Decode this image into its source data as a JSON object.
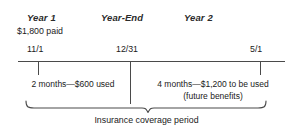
{
  "diagram": {
    "title_caption": "Insurance coverage period",
    "periods": [
      {
        "label": "Year 1",
        "name": "year-one"
      },
      {
        "label": "Year-End",
        "name": "year-end"
      },
      {
        "label": "Year 2",
        "name": "year-two"
      }
    ],
    "paid_note": "$1,800 paid",
    "dates": [
      {
        "label": "11/1",
        "name": "start"
      },
      {
        "label": "12/31",
        "name": "year-end"
      },
      {
        "label": "5/1",
        "name": "end"
      }
    ],
    "segments": {
      "left": {
        "line1": "2 months—$600 used"
      },
      "right": {
        "line1": "4 months—$1,200 to be used",
        "line2": "(future benefits)"
      }
    },
    "colors": {
      "line": "#4a4a4a",
      "text": "#1a1a1a",
      "background": "#ffffff"
    }
  }
}
